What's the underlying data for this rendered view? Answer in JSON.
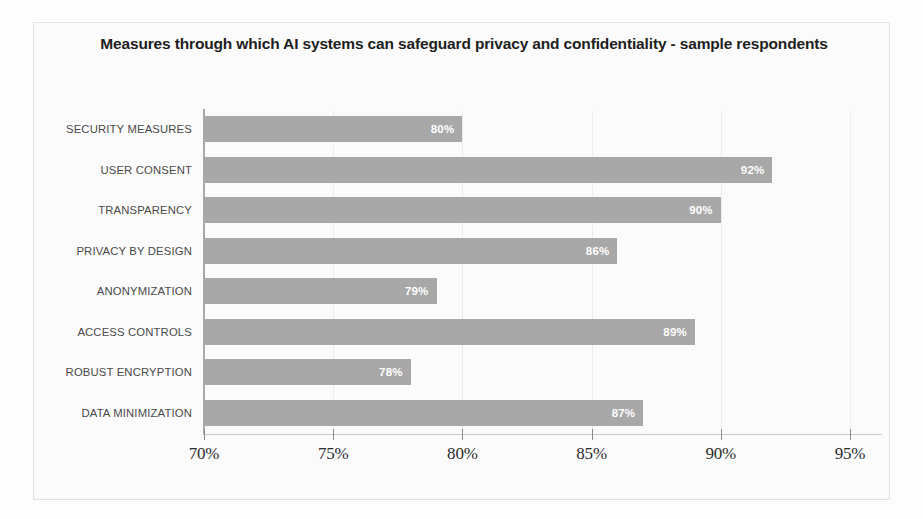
{
  "chart_data": {
    "type": "bar",
    "orientation": "horizontal",
    "title": "Measures through which AI systems can safeguard privacy and confidentiality - sample respondents",
    "xlabel": "",
    "ylabel": "",
    "categories": [
      "SECURITY MEASURES",
      "USER CONSENT",
      "TRANSPARENCY",
      "PRIVACY BY DESIGN",
      "ANONYMIZATION",
      "ACCESS CONTROLS",
      "ROBUST ENCRYPTION",
      "DATA MINIMIZATION"
    ],
    "values": [
      80,
      92,
      90,
      86,
      79,
      89,
      78,
      87
    ],
    "data_labels": [
      "80%",
      "92%",
      "90%",
      "86%",
      "79%",
      "89%",
      "78%",
      "87%"
    ],
    "xlim": [
      70,
      95
    ],
    "xticks": [
      70,
      75,
      80,
      85,
      90,
      95
    ],
    "xtick_labels": [
      "70%",
      "75%",
      "80%",
      "85%",
      "90%",
      "95%"
    ],
    "grid": true,
    "grid_axis": "x",
    "legend": false,
    "series": [
      {
        "name": "sample respondents",
        "values": [
          80,
          92,
          90,
          86,
          79,
          89,
          78,
          87
        ]
      }
    ],
    "colors": {
      "bar": "#a8a8a8",
      "data_label": "#ffffff",
      "category_label": "#4a4a4a",
      "tick_label": "#2b2b2b",
      "gridline": "#ebebeb",
      "axis": "#a9a9a9",
      "panel_background": "#fbfbfb",
      "panel_border": "#e2e2e2",
      "page_background": "#fdfdfd",
      "title": "#1e1e1e"
    }
  }
}
